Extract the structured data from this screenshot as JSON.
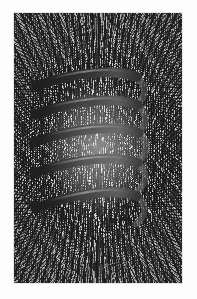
{
  "figure": {
    "kind": "photograph",
    "alt_text": "Iron filings sprinkled on a card reveal the magnetic field of a helical solenoid of five visible turns; filings fan radially outward from the top and bottom poles and run nearly straight and parallel inside the coil.",
    "frame": {
      "x": 14,
      "y": 13,
      "width": 168,
      "height": 270
    },
    "tone": {
      "paper": "#fdfdfd",
      "plate_background": "#ddddda",
      "filings": "#1a1a1a",
      "coil_dark": "#151515",
      "coil_mid": "#3e3e3e",
      "coil_highlight": "#8d8d8d",
      "coil_back_turn": "#6b6b6b"
    }
  },
  "chart_data": {
    "type": "scatter",
    "title": "",
    "subtitle": "",
    "xlabel": "",
    "ylabel": "",
    "grid": false,
    "legend": "none",
    "annotations": [],
    "coil": {
      "visible_front_turns": 5,
      "axis_orientation": "vertical",
      "bore_left_x": 52,
      "bore_right_x": 150,
      "turns": [
        {
          "index": 1,
          "left_end_y": 97,
          "right_end_y": 88,
          "left_x": 50,
          "right_x": 152
        },
        {
          "index": 2,
          "left_end_y": 125,
          "right_end_y": 116,
          "left_x": 49,
          "right_x": 153
        },
        {
          "index": 3,
          "left_end_y": 153,
          "right_end_y": 144,
          "left_x": 48,
          "right_x": 154
        },
        {
          "index": 4,
          "left_end_y": 184,
          "right_end_y": 174,
          "left_x": 48,
          "right_x": 153
        },
        {
          "index": 5,
          "left_end_y": 219,
          "right_end_y": 207,
          "left_x": 49,
          "right_x": 152
        }
      ]
    },
    "field_regions": [
      {
        "name": "top-pole-fan",
        "center_x": 98,
        "center_y": 82,
        "pattern": "radial-divergent",
        "density": "high"
      },
      {
        "name": "bottom-pole-fan",
        "center_x": 98,
        "center_y": 228,
        "pattern": "radial-divergent",
        "density": "high"
      },
      {
        "name": "solenoid-interior",
        "center_x": 98,
        "center_y": 156,
        "pattern": "axial-parallel",
        "density": "high"
      },
      {
        "name": "left-return-flux",
        "center_x": 32,
        "center_y": 150,
        "pattern": "curved-return",
        "density": "medium"
      },
      {
        "name": "right-return-flux",
        "center_x": 166,
        "center_y": 150,
        "pattern": "curved-return",
        "density": "medium"
      }
    ]
  }
}
